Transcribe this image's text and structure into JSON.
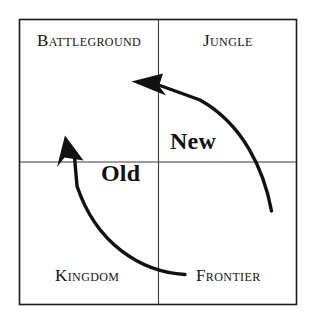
{
  "figure": {
    "type": "two-by-two-matrix-diagram",
    "background_color": "#ffffff",
    "line_color": "#1a1a1a",
    "text_color": "#141414"
  },
  "quadrants": [
    {
      "label": "Battleground",
      "position": "top-left"
    },
    {
      "label": "Jungle",
      "position": "top-right"
    },
    {
      "label": "Kingdom",
      "position": "bottom-left"
    },
    {
      "label": "Frontier",
      "position": "bottom-right"
    }
  ],
  "axis_labels": {
    "new": "New",
    "old": "Old"
  },
  "arrows": [
    {
      "name": "frontier-to-battleground-lower-arc",
      "from": "Frontier",
      "to": "Battleground",
      "direction": "up"
    },
    {
      "name": "jungle-to-battleground-upper-arc",
      "from": "Jungle",
      "to": "Battleground",
      "direction": "left"
    }
  ]
}
